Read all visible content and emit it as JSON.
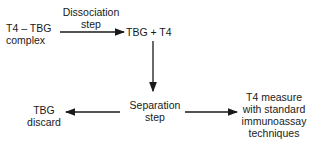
{
  "nodes": {
    "complex": [
      "T4 – TBG",
      "complex"
    ],
    "dissociation_label": [
      "Dissociation",
      "step"
    ],
    "products": "TBG + T4",
    "separation": [
      "Separation",
      "step"
    ],
    "discard": [
      "TBG",
      "discard"
    ],
    "measure": [
      "T4 measure",
      "with standard",
      "immunoassay",
      "techniques"
    ]
  },
  "colors": {
    "line": "#1a1a1a",
    "text": "#1a1a1a"
  }
}
